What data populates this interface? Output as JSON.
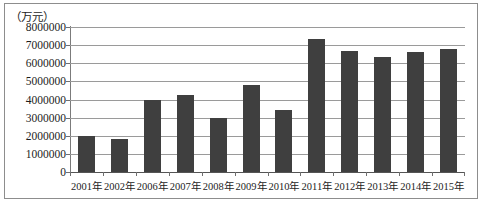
{
  "chart_data": {
    "type": "bar",
    "title": "",
    "subtitle": "",
    "xlabel": "",
    "ylabel": "（万元）",
    "ylim": [
      0,
      8000000
    ],
    "ytick_step": 1000000,
    "grid": true,
    "legend": null,
    "bar_color": "#3f3f3f",
    "categories": [
      "2001年",
      "2002年",
      "2006年",
      "2007年",
      "2008年",
      "2009年",
      "2010年",
      "2011年",
      "2012年",
      "2013年",
      "2014年",
      "2015年"
    ],
    "values": [
      2000000,
      1800000,
      3950000,
      4250000,
      3000000,
      4800000,
      3400000,
      7350000,
      6700000,
      6350000,
      6600000,
      6800000
    ],
    "ytick_labels": [
      "8000000",
      "7000000",
      "6000000",
      "5000000",
      "4000000",
      "3000000",
      "2000000",
      "1000000",
      "0"
    ],
    "ytick_values": [
      8000000,
      7000000,
      6000000,
      5000000,
      4000000,
      3000000,
      2000000,
      1000000,
      0
    ]
  }
}
